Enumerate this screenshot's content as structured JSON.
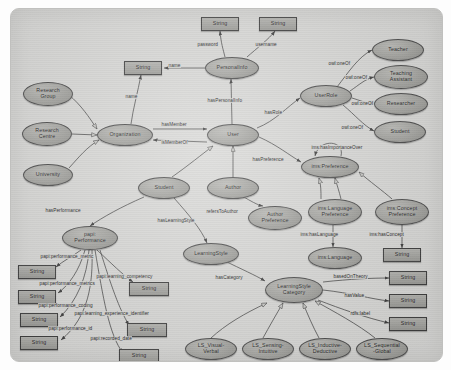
{
  "diagram": {
    "canvas": {
      "background": "#d8d8d6",
      "border": "#c0c0be"
    },
    "colors": {
      "class_fill": "#a6a6a2",
      "literal_fill": "#a8a8a4",
      "stroke": "#3d3d3d"
    },
    "nodes": [
      {
        "id": "str_password",
        "label": "String",
        "shape": "rect",
        "x": 190,
        "y": 8,
        "w": 38,
        "h": 14
      },
      {
        "id": "str_username",
        "label": "String",
        "shape": "rect",
        "x": 248,
        "y": 8,
        "w": 38,
        "h": 14
      },
      {
        "id": "str_name",
        "label": "String",
        "shape": "rect",
        "x": 113,
        "y": 52,
        "w": 38,
        "h": 14
      },
      {
        "id": "personalinfo",
        "label": "PersonalInfo",
        "shape": "ellipse",
        "x": 194,
        "y": 48,
        "w": 54,
        "h": 22
      },
      {
        "id": "teacher",
        "label": "Teacher",
        "shape": "ellipse",
        "x": 361,
        "y": 30,
        "w": 52,
        "h": 22
      },
      {
        "id": "teachassist",
        "label": "Teaching\nAssistant",
        "shape": "ellipse",
        "x": 363,
        "y": 56,
        "w": 54,
        "h": 24
      },
      {
        "id": "researcher",
        "label": "Researcher",
        "shape": "ellipse",
        "x": 363,
        "y": 84,
        "w": 54,
        "h": 22
      },
      {
        "id": "student_role",
        "label": "Student",
        "shape": "ellipse",
        "x": 363,
        "y": 112,
        "w": 52,
        "h": 22
      },
      {
        "id": "userrole",
        "label": "UserRole",
        "shape": "ellipse",
        "x": 289,
        "y": 76,
        "w": 52,
        "h": 22
      },
      {
        "id": "researchgroup",
        "label": "Research\nGroup",
        "shape": "ellipse",
        "x": 12,
        "y": 73,
        "w": 50,
        "h": 24
      },
      {
        "id": "researchcentre",
        "label": "Research\nCentre",
        "shape": "ellipse",
        "x": 11,
        "y": 113,
        "w": 50,
        "h": 24
      },
      {
        "id": "university",
        "label": "University",
        "shape": "ellipse",
        "x": 12,
        "y": 155,
        "w": 50,
        "h": 22
      },
      {
        "id": "organization",
        "label": "Organization",
        "shape": "ellipse",
        "x": 86,
        "y": 115,
        "w": 56,
        "h": 22
      },
      {
        "id": "user",
        "label": "User",
        "shape": "ellipse",
        "x": 196,
        "y": 115,
        "w": 52,
        "h": 22
      },
      {
        "id": "student",
        "label": "Student",
        "shape": "ellipse",
        "x": 127,
        "y": 168,
        "w": 52,
        "h": 22
      },
      {
        "id": "author",
        "label": "Author",
        "shape": "ellipse",
        "x": 196,
        "y": 168,
        "w": 52,
        "h": 22
      },
      {
        "id": "authorpref",
        "label": "Author\nPreference",
        "shape": "ellipse",
        "x": 237,
        "y": 197,
        "w": 54,
        "h": 24
      },
      {
        "id": "imspref",
        "label": "ims:Preference",
        "shape": "ellipse",
        "x": 290,
        "y": 147,
        "w": 58,
        "h": 22
      },
      {
        "id": "imslangpref",
        "label": "ims:Language\nPreference",
        "shape": "ellipse",
        "x": 297,
        "y": 190,
        "w": 54,
        "h": 26
      },
      {
        "id": "imsconceptpref",
        "label": "ims:Concept\nPreference",
        "shape": "ellipse",
        "x": 364,
        "y": 190,
        "w": 54,
        "h": 26
      },
      {
        "id": "imslanguage",
        "label": "ims:Language",
        "shape": "ellipse",
        "x": 297,
        "y": 238,
        "w": 54,
        "h": 22
      },
      {
        "id": "str_concept",
        "label": "String",
        "shape": "rect",
        "x": 372,
        "y": 239,
        "w": 38,
        "h": 14
      },
      {
        "id": "papiperf",
        "label": "papi:\nPerformance",
        "shape": "ellipse",
        "x": 51,
        "y": 217,
        "w": 56,
        "h": 24
      },
      {
        "id": "learningstyle",
        "label": "LearningStyle",
        "shape": "ellipse",
        "x": 172,
        "y": 234,
        "w": 56,
        "h": 22
      },
      {
        "id": "lscategory",
        "label": "LearningStyle\nCategory",
        "shape": "ellipse",
        "x": 254,
        "y": 268,
        "w": 58,
        "h": 26
      },
      {
        "id": "str_value_1",
        "label": "String",
        "shape": "rect",
        "x": 378,
        "y": 262,
        "w": 38,
        "h": 14
      },
      {
        "id": "str_value_2",
        "label": "String",
        "shape": "rect",
        "x": 378,
        "y": 285,
        "w": 38,
        "h": 14
      },
      {
        "id": "str_value_3",
        "label": "String",
        "shape": "rect",
        "x": 378,
        "y": 308,
        "w": 38,
        "h": 14
      },
      {
        "id": "str_p1",
        "label": "String",
        "shape": "rect",
        "x": 7,
        "y": 256,
        "w": 38,
        "h": 14
      },
      {
        "id": "str_p2",
        "label": "String",
        "shape": "rect",
        "x": 7,
        "y": 281,
        "w": 38,
        "h": 14
      },
      {
        "id": "str_p3",
        "label": "String",
        "shape": "rect",
        "x": 9,
        "y": 304,
        "w": 38,
        "h": 14
      },
      {
        "id": "str_p4",
        "label": "String",
        "shape": "rect",
        "x": 9,
        "y": 327,
        "w": 38,
        "h": 14
      },
      {
        "id": "str_p5",
        "label": "String",
        "shape": "rect",
        "x": 118,
        "y": 273,
        "w": 40,
        "h": 14
      },
      {
        "id": "str_p6",
        "label": "String",
        "shape": "rect",
        "x": 116,
        "y": 314,
        "w": 40,
        "h": 14
      },
      {
        "id": "str_p7",
        "label": "String",
        "shape": "rect",
        "x": 108,
        "y": 340,
        "w": 40,
        "h": 14
      },
      {
        "id": "ls_vv",
        "label": "LS_Visual-\nVerbal",
        "shape": "ellipse",
        "x": 174,
        "y": 329,
        "w": 52,
        "h": 22
      },
      {
        "id": "ls_si",
        "label": "LS_Sensing-\nIntuitive",
        "shape": "ellipse",
        "x": 231,
        "y": 329,
        "w": 52,
        "h": 22
      },
      {
        "id": "ls_id",
        "label": "LS_Inductive-\nDeductive",
        "shape": "ellipse",
        "x": 288,
        "y": 329,
        "w": 52,
        "h": 22
      },
      {
        "id": "ls_sg",
        "label": "LS_Sequential\n-Global",
        "shape": "ellipse",
        "x": 345,
        "y": 329,
        "w": 52,
        "h": 22
      }
    ],
    "edge_labels": [
      {
        "id": "el_password",
        "text": "password",
        "x": 186,
        "y": 33
      },
      {
        "id": "el_username",
        "text": "username",
        "x": 244,
        "y": 33
      },
      {
        "id": "el_name_pi",
        "text": "name",
        "x": 157,
        "y": 54
      },
      {
        "id": "el_haspersonal",
        "text": "hasPersonalInfo",
        "x": 196,
        "y": 89
      },
      {
        "id": "el_hasrole",
        "text": "hasRole",
        "x": 253,
        "y": 101
      },
      {
        "id": "el_oneof1",
        "text": "owl:oneOf",
        "x": 317,
        "y": 52
      },
      {
        "id": "el_oneof2",
        "text": "owl:oneOf",
        "x": 334,
        "y": 66
      },
      {
        "id": "el_oneof3",
        "text": "owl:oneOf",
        "x": 340,
        "y": 92
      },
      {
        "id": "el_oneof4",
        "text": "owl:oneOf",
        "x": 330,
        "y": 116
      },
      {
        "id": "el_name_org",
        "text": "name",
        "x": 114,
        "y": 85
      },
      {
        "id": "el_hasmember",
        "text": "hasMember",
        "x": 150,
        "y": 113
      },
      {
        "id": "el_ismemberof",
        "text": "isMemberOf",
        "x": 150,
        "y": 131
      },
      {
        "id": "el_haspref",
        "text": "hasPreference",
        "x": 241,
        "y": 148
      },
      {
        "id": "el_importance",
        "text": "ims:hasImportanceOver",
        "x": 300,
        "y": 136
      },
      {
        "id": "el_hasperf",
        "text": "hasPerformance",
        "x": 34,
        "y": 199
      },
      {
        "id": "el_haslearnsty",
        "text": "hasLearningStyle",
        "x": 146,
        "y": 209
      },
      {
        "id": "el_referstoauth",
        "text": "refersToAuthor",
        "x": 195,
        "y": 200
      },
      {
        "id": "el_imslang",
        "text": "ims:hasLanguage",
        "x": 289,
        "y": 223
      },
      {
        "id": "el_imsconcept",
        "text": "ims:hasConcept",
        "x": 358,
        "y": 223
      },
      {
        "id": "el_hascategory",
        "text": "hasCategory",
        "x": 204,
        "y": 266
      },
      {
        "id": "el_basedon",
        "text": "basedOnTheory",
        "x": 322,
        "y": 265
      },
      {
        "id": "el_hasvalue",
        "text": "hasValue",
        "x": 333,
        "y": 284
      },
      {
        "id": "el_rdfslabel",
        "text": "rdfs:label",
        "x": 339,
        "y": 302
      },
      {
        "id": "el_p_metric",
        "text": "papi:performance_metric",
        "x": 29,
        "y": 245
      },
      {
        "id": "el_p_metric2",
        "text": "papi:performance_metrics",
        "x": 28,
        "y": 272
      },
      {
        "id": "el_p_comp",
        "text": "papi:learning_competency",
        "x": 85,
        "y": 265
      },
      {
        "id": "el_p_coding",
        "text": "papi:performance_coding",
        "x": 27,
        "y": 294
      },
      {
        "id": "el_p_lei",
        "text": "papi:learning_experience_identifier",
        "x": 63,
        "y": 302
      },
      {
        "id": "el_p_id",
        "text": "papi:performance_id",
        "x": 37,
        "y": 317
      },
      {
        "id": "el_p_date",
        "text": "papi:recorded_date",
        "x": 79,
        "y": 327
      }
    ]
  }
}
